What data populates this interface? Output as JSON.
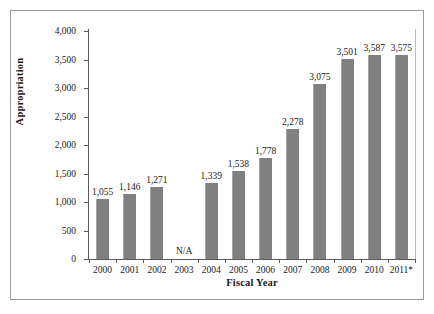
{
  "chart_data": {
    "type": "bar",
    "title": "",
    "xlabel": "Fiscal Year",
    "ylabel": "Appropriation",
    "categories": [
      "2000",
      "2001",
      "2002",
      "2003",
      "2004",
      "2005",
      "2006",
      "2007",
      "2008",
      "2009",
      "2010",
      "2011*"
    ],
    "values": [
      1055,
      1146,
      1271,
      null,
      1339,
      1538,
      1778,
      2278,
      3075,
      3501,
      3587,
      3575
    ],
    "value_labels": [
      "1,055",
      "1,146",
      "1,271",
      "N/A",
      "1,339",
      "1,538",
      "1,778",
      "2,278",
      "3,075",
      "3,501",
      "3,587",
      "3,575"
    ],
    "missing_label": "N/A",
    "ylim": [
      0,
      4000
    ],
    "ytick_values": [
      0,
      500,
      1000,
      1500,
      2000,
      2500,
      3000,
      3500,
      4000
    ],
    "ytick_labels": [
      "0",
      "500",
      "1,000",
      "1,500",
      "2,000",
      "2,500",
      "3,000",
      "3,500",
      "4,000"
    ],
    "grid": false,
    "legend": null,
    "bar_color": "#808080",
    "axis_color": "#5a5a5a",
    "frame_color": "#9a9a9a",
    "background": "#ffffff"
  }
}
